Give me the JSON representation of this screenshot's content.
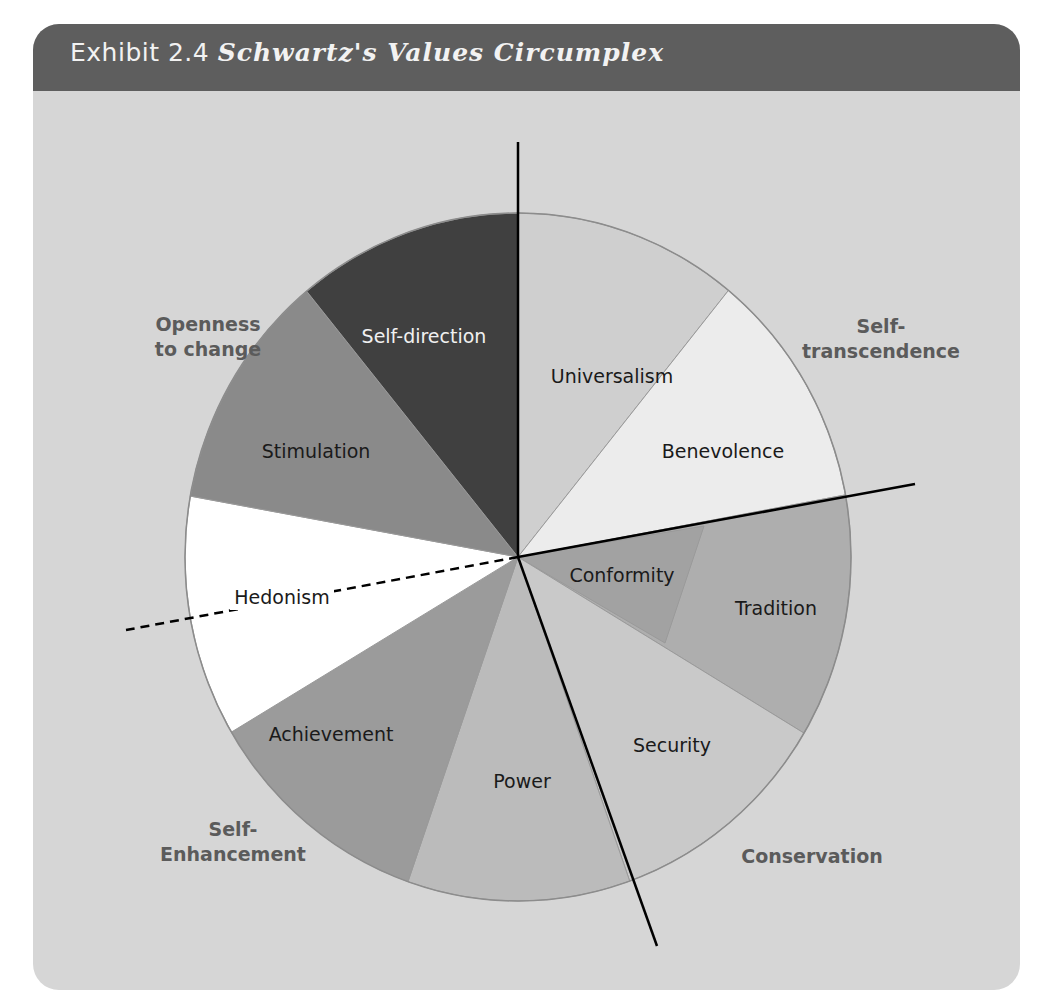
{
  "header": {
    "exhibit": "Exhibit 2.4",
    "title": "Schwartz's Values Circumplex"
  },
  "colors": {
    "header_bg": "#5e5e5e",
    "panel_bg": "#d6d6d6",
    "title_text": "#f2f2f2",
    "group_label": "#5b5b5b"
  },
  "circle": {
    "cx": 518,
    "cy": 557,
    "rx": 333,
    "ry": 344
  },
  "values": [
    {
      "name": "Universalism",
      "start": -90,
      "end": -50.8,
      "fill": "#cfcfcf",
      "text_fill": "#1a1a1a",
      "label_x": 612,
      "label_y": 383
    },
    {
      "name": "Benevolence",
      "start": -50.8,
      "end": -10.4,
      "fill": "#ececec",
      "text_fill": "#1a1a1a",
      "label_x": 723,
      "label_y": 458
    },
    {
      "name": "Tradition",
      "start": -10.4,
      "end": 30.8,
      "fill": "#aeaeae",
      "text_fill": "#1a1a1a",
      "label_x": 776,
      "label_y": 615
    },
    {
      "name": "Conformity",
      "start": -10.4,
      "end": 30.3,
      "fill": "#a2a2a2",
      "text_fill": "#1a1a1a",
      "label_x": 622,
      "label_y": 582,
      "inner_chord": [
        [
          704,
          526
        ],
        [
          665,
          643
        ]
      ]
    },
    {
      "name": "Security",
      "start": 30.8,
      "end": 70.4,
      "fill": "#c9c9c9",
      "text_fill": "#1a1a1a",
      "label_x": 672,
      "label_y": 752
    },
    {
      "name": "Power",
      "start": 70.4,
      "end": 109.3,
      "fill": "#bbbbbb",
      "text_fill": "#1a1a1a",
      "label_x": 522,
      "label_y": 788
    },
    {
      "name": "Achievement",
      "start": 109.3,
      "end": 149.4,
      "fill": "#9b9b9b",
      "text_fill": "#1a1a1a",
      "label_x": 331,
      "label_y": 741
    },
    {
      "name": "Hedonism",
      "start": 149.4,
      "end": 190.2,
      "fill": "#ffffff",
      "text_fill": "#1a1a1a",
      "label_x": 282,
      "label_y": 604
    },
    {
      "name": "Stimulation",
      "start": 190.2,
      "end": 230.6,
      "fill": "#8a8a8a",
      "text_fill": "#1a1a1a",
      "label_x": 316,
      "label_y": 458
    },
    {
      "name": "Self-direction",
      "start": 230.6,
      "end": 270,
      "fill": "#404040",
      "text_fill": "#f0f0f0",
      "label_x": 424,
      "label_y": 343
    }
  ],
  "groups": [
    {
      "lines": [
        "Openness",
        "to change"
      ],
      "x": 208,
      "y": 331
    },
    {
      "lines": [
        "Self-",
        "transcendence"
      ],
      "x": 881,
      "y": 333
    },
    {
      "lines": [
        "Conservation"
      ],
      "x": 812,
      "y": 863
    },
    {
      "lines": [
        "Self-",
        "Enhancement"
      ],
      "x": 233,
      "y": 836
    }
  ],
  "divider_lines": [
    {
      "name": "vertical-divider",
      "x1": 518,
      "y1": 142,
      "x2": 518,
      "y2": 557,
      "dashed": false
    },
    {
      "name": "right-divider",
      "x1": 518,
      "y1": 557,
      "x2": 915,
      "y2": 484,
      "dashed": false
    },
    {
      "name": "lower-divider",
      "x1": 518,
      "y1": 557,
      "x2": 657,
      "y2": 946,
      "dashed": false
    },
    {
      "name": "hedonism-dashed-divider",
      "x1": 518,
      "y1": 557,
      "x2": 126,
      "y2": 630,
      "dashed": true
    }
  ]
}
